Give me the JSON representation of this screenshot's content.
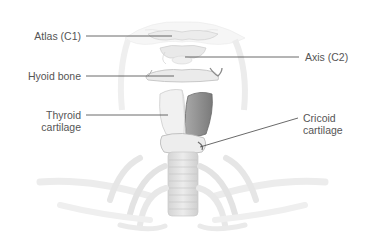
{
  "diagram": {
    "type": "anatomical-illustration",
    "colors": {
      "background": "#ffffff",
      "bone": "#e6e6e6",
      "bone_edge": "#c4c4c4",
      "highlight_cartilage": "#8f8f8f",
      "leader_line": "#444444",
      "label_text": "#555555"
    },
    "labels": [
      {
        "id": "atlas",
        "text": "Atlas (C1)",
        "side": "left"
      },
      {
        "id": "axis",
        "text": "Axis (C2)",
        "side": "right"
      },
      {
        "id": "hyoid",
        "text": "Hyoid bone",
        "side": "left"
      },
      {
        "id": "thyroid",
        "line1": "Thyroid",
        "line2": "cartilage",
        "side": "left"
      },
      {
        "id": "cricoid",
        "line1": "Cricoid",
        "line2": "cartilage",
        "side": "right"
      }
    ]
  }
}
